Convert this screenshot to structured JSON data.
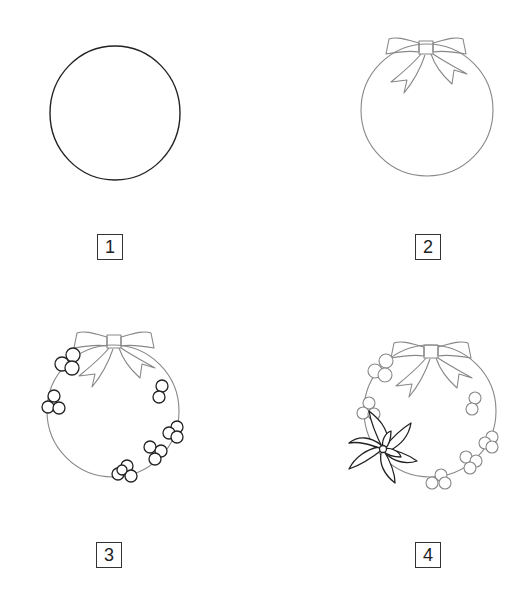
{
  "steps": [
    {
      "number": "1",
      "description": "circle"
    },
    {
      "number": "2",
      "description": "circle with bow"
    },
    {
      "number": "3",
      "description": "wreath with bow and berry clusters"
    },
    {
      "number": "4",
      "description": "wreath with bow, berries and poinsettia"
    }
  ],
  "colors": {
    "stroke_dark": "#222222",
    "stroke_light": "#888888",
    "background": "#ffffff"
  }
}
